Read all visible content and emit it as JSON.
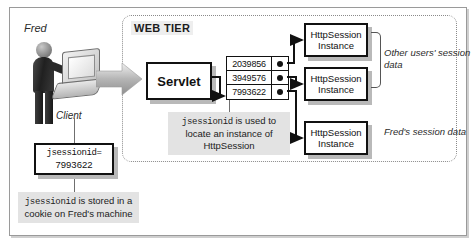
{
  "figure": {
    "client": {
      "person_label": "Fred",
      "client_label": "Client"
    },
    "web_tier": {
      "title": "WEB TIER",
      "servlet_label": "Servlet",
      "session_ids": [
        "2039856",
        "3949576",
        "7993622"
      ],
      "session_instances": [
        {
          "line1": "HttpSession",
          "line2": "Instance"
        },
        {
          "line1": "HttpSession",
          "line2": "Instance"
        },
        {
          "line1": "HttpSession",
          "line2": "Instance"
        }
      ],
      "annotations": {
        "other_users": "Other users' session data",
        "freds_data": "Fred's session data"
      },
      "caption_mid": {
        "code": "jsessionid",
        "rest": " is used to locate an instance of HttpSession"
      }
    },
    "cookie": {
      "line1": "jsessionid=",
      "line2": "7993622"
    },
    "caption_bottom": {
      "code": "jsessionid",
      "rest": " is stored in a cookie on Fred's machine"
    },
    "colors": {
      "ink": "#111111",
      "frame": "#9a9a9a",
      "caption_bg": "#e3e3e3",
      "shadow": "#b9b9b9",
      "panel_border": "#8a8a8a"
    }
  }
}
